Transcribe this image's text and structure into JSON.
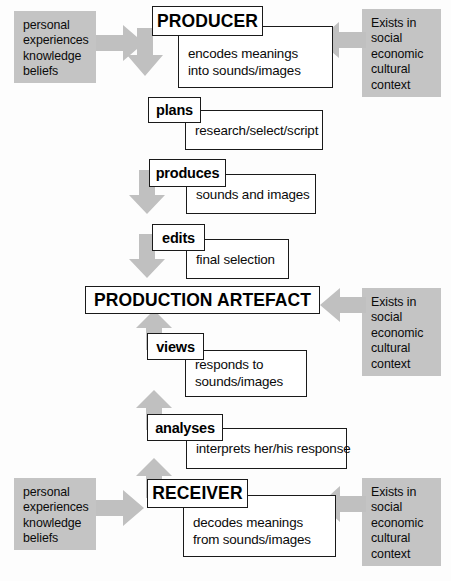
{
  "diagram": {
    "colors": {
      "panel_gray": "#c4c4c4",
      "arrow_gray": "#c0c0c0",
      "box_border": "#1a1a1a",
      "background": "#fdfdfd",
      "text": "#0a0a0a"
    },
    "context_panels": [
      {
        "name": "personal-context-producer",
        "text": "personal\nexperiences\nknowledge\nbeliefs"
      },
      {
        "name": "social-context-producer",
        "text": "Exists in\nsocial\neconomic\ncultural\ncontext"
      },
      {
        "name": "social-context-artefact",
        "text": "Exists in\nsocial\neconomic\ncultural\ncontext"
      },
      {
        "name": "personal-context-receiver",
        "text": "personal\nexperiences\nknowledge\nbeliefs"
      },
      {
        "name": "social-context-receiver",
        "text": "Exists in\nsocial\neconomic\ncultural\ncontext"
      }
    ],
    "stages": [
      {
        "id": "producer",
        "label": "PRODUCER",
        "description": "encodes meanings\ninto sounds/images"
      },
      {
        "id": "plans",
        "label": "plans",
        "description": "research/select/script"
      },
      {
        "id": "produces",
        "label": "produces",
        "description": "sounds and images"
      },
      {
        "id": "edits",
        "label": "edits",
        "description": "final selection"
      },
      {
        "id": "production-artefact",
        "label": "PRODUCTION ARTEFACT",
        "description": ""
      },
      {
        "id": "views",
        "label": "views",
        "description": "responds to\nsounds/images"
      },
      {
        "id": "analyses",
        "label": "analyses",
        "description": "interprets her/his response"
      },
      {
        "id": "receiver",
        "label": "RECEIVER",
        "description": "decodes meanings\nfrom sounds/images"
      }
    ],
    "arrows": [
      {
        "name": "arrow-right-to-producer",
        "direction": "right"
      },
      {
        "name": "arrow-left-to-producer",
        "direction": "left"
      },
      {
        "name": "arrow-down-producer-to-plans",
        "direction": "down"
      },
      {
        "name": "arrow-down-plans-to-produces",
        "direction": "down"
      },
      {
        "name": "arrow-down-produces-to-edits",
        "direction": "down"
      },
      {
        "name": "arrow-left-to-artefact",
        "direction": "left"
      },
      {
        "name": "arrow-up-views-to-artefact",
        "direction": "up"
      },
      {
        "name": "arrow-up-analyses-to-views",
        "direction": "up"
      },
      {
        "name": "arrow-up-receiver-to-analyses",
        "direction": "up"
      },
      {
        "name": "arrow-right-to-receiver",
        "direction": "right"
      },
      {
        "name": "arrow-left-to-receiver",
        "direction": "left"
      }
    ]
  }
}
